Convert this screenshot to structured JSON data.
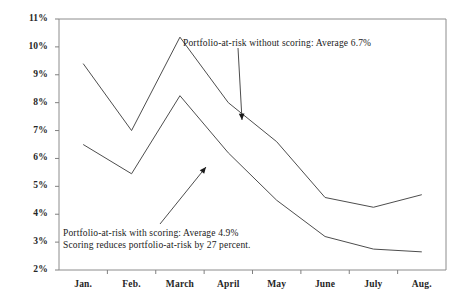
{
  "chart_data": {
    "type": "line",
    "title": "",
    "subtitle": "",
    "xlabel": "",
    "ylabel": "",
    "categories": [
      "Jan.",
      "Feb.",
      "March",
      "April",
      "May",
      "June",
      "July",
      "Aug."
    ],
    "ylim": [
      2,
      11
    ],
    "ytick_step": 1,
    "ytick_labels": [
      "11%",
      "10%",
      "9%",
      "8%",
      "7%",
      "6%",
      "5%",
      "4%",
      "3%",
      "2%"
    ],
    "ytick_values": [
      11,
      10,
      9,
      8,
      7,
      6,
      5,
      4,
      3,
      2
    ],
    "grid": false,
    "legend_position": "none",
    "line_color": "#4d4d4d",
    "axis_color": "#808080",
    "series": [
      {
        "name": "Portfolio-at-risk without scoring",
        "values": [
          9.4,
          7.0,
          10.35,
          8.0,
          6.6,
          4.6,
          4.25,
          4.7
        ],
        "average": 6.7
      },
      {
        "name": "Portfolio-at-risk with scoring",
        "values": [
          6.5,
          5.45,
          8.25,
          6.2,
          4.5,
          3.2,
          2.75,
          2.65
        ],
        "average": 4.9
      }
    ],
    "annotations": [
      {
        "id": "annotation-without-scoring",
        "lines": [
          "Portfolio-at-risk without scoring: Average 6.7%"
        ],
        "text_x": 183,
        "text_y": 37,
        "arrow_from_x": 238,
        "arrow_from_y": 48,
        "arrow_to_x": 242,
        "arrow_to_y": 120
      },
      {
        "id": "annotation-with-scoring",
        "lines": [
          "Portfolio-at-risk with scoring: Average 4.9%",
          "Scoring reduces portfolio-at-risk by 27 percent."
        ],
        "text_x": 63,
        "text_y": 227,
        "arrow_from_x": 160,
        "arrow_from_y": 224,
        "arrow_to_x": 206,
        "arrow_to_y": 167
      }
    ]
  },
  "axes": {
    "plot_left": 59,
    "plot_right": 446,
    "plot_top": 19,
    "plot_bottom": 270
  }
}
